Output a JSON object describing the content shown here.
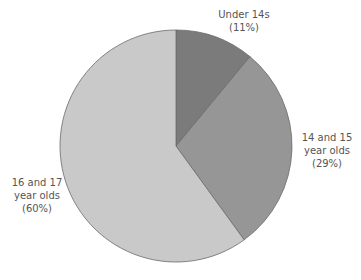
{
  "chart_data": {
    "type": "pie",
    "title": "",
    "categories": [
      "Under 14s",
      "14 and 15 year olds",
      "16 and 17 year olds"
    ],
    "values": [
      11,
      29,
      60
    ],
    "unit": "%",
    "colors": [
      "#7b7b7b",
      "#969696",
      "#c9c9c9"
    ],
    "start_angle": "12 o'clock",
    "direction": "clockwise",
    "legend": "none (direct labels)",
    "labels": [
      {
        "lines": [
          "Under 14s",
          "(11%)"
        ]
      },
      {
        "lines": [
          "14 and 15",
          "year olds",
          "(29%)"
        ]
      },
      {
        "lines": [
          "16 and 17",
          "year olds",
          "(60%)"
        ]
      }
    ]
  }
}
